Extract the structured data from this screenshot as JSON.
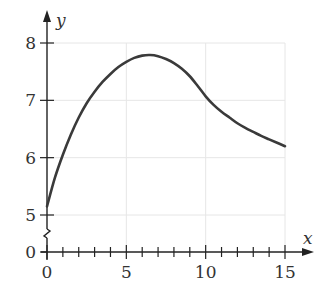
{
  "chart_data": {
    "type": "line",
    "title": "",
    "xlabel": "x",
    "ylabel": "y",
    "xlim": [
      0,
      15
    ],
    "ylim": [
      5,
      8
    ],
    "y_axis_break": true,
    "y_axis_zero_label": "0",
    "grid": true,
    "x_ticks": [
      0,
      5,
      10,
      15
    ],
    "x_tick_labels": [
      "0",
      "5",
      "10",
      "15"
    ],
    "x_minor_tick_step": 1,
    "y_ticks": [
      5,
      6,
      7,
      8
    ],
    "y_tick_labels": [
      "5",
      "6",
      "7",
      "8"
    ],
    "series": [
      {
        "name": "curve",
        "x": [
          0,
          0.5,
          1,
          1.5,
          2,
          2.5,
          3,
          3.5,
          4,
          4.5,
          5,
          5.5,
          6,
          6.5,
          7,
          7.5,
          8,
          8.5,
          9,
          9.5,
          10,
          10.5,
          11,
          11.5,
          12,
          12.5,
          13,
          13.5,
          14,
          14.5,
          15
        ],
        "y": [
          5.15,
          5.65,
          6.05,
          6.4,
          6.7,
          6.95,
          7.15,
          7.32,
          7.46,
          7.58,
          7.67,
          7.74,
          7.78,
          7.79,
          7.77,
          7.72,
          7.65,
          7.55,
          7.42,
          7.25,
          7.07,
          6.92,
          6.8,
          6.7,
          6.6,
          6.52,
          6.45,
          6.38,
          6.32,
          6.26,
          6.2
        ]
      }
    ],
    "colors": {
      "curve": "#3a3a3a",
      "axis": "#222222",
      "grid": "#e6e6e6"
    }
  }
}
